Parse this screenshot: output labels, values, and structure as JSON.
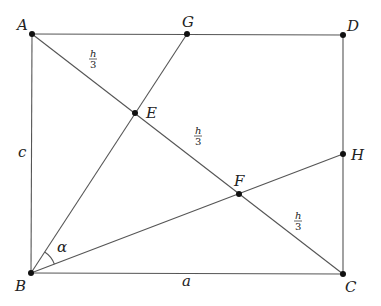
{
  "figure": {
    "type": "geometry-rectangle-diagram",
    "background": "#ffffff",
    "line_color": "#555555",
    "point_color": "#111111"
  },
  "points": {
    "A": {
      "label": "A",
      "x": 32,
      "y": 34
    },
    "B": {
      "label": "B",
      "x": 31,
      "y": 273
    },
    "C": {
      "label": "C",
      "x": 343,
      "y": 274
    },
    "D": {
      "label": "D",
      "x": 343,
      "y": 35
    },
    "E": {
      "label": "E",
      "x": 135,
      "y": 113
    },
    "F": {
      "label": "F",
      "x": 239,
      "y": 194
    },
    "G": {
      "label": "G",
      "x": 187,
      "y": 34
    },
    "H": {
      "label": "H",
      "x": 343,
      "y": 154
    }
  },
  "segments": [
    [
      "A",
      "D"
    ],
    [
      "D",
      "C"
    ],
    [
      "C",
      "B"
    ],
    [
      "B",
      "A"
    ],
    [
      "A",
      "C"
    ],
    [
      "B",
      "G"
    ],
    [
      "B",
      "H"
    ]
  ],
  "labels": {
    "side_left": "c",
    "side_bottom": "a",
    "angle_B": "α",
    "segment_AE_num": "h",
    "segment_AE_den": "3",
    "segment_EF_num": "h",
    "segment_EF_den": "3",
    "segment_FC_num": "h",
    "segment_FC_den": "3"
  }
}
